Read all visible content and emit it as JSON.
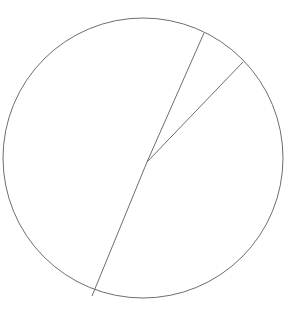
{
  "figure": {
    "type": "geometry-diagram",
    "background_color": "#ffffff",
    "stroke_color": "#6e6e6e",
    "stroke_width": 1,
    "canvas": {
      "width": 304,
      "height": 316
    },
    "circle": {
      "label": "circle",
      "center_x": 143,
      "center_y": 158,
      "radius": 140,
      "bounds": {
        "left": 3,
        "right": 283,
        "top": 18,
        "bottom": 298
      }
    },
    "center_point": {
      "label": "center",
      "x": 147,
      "y": 162
    },
    "radii": [
      {
        "label": "radius-upper-left",
        "from_x": 147,
        "from_y": 162,
        "to_x": 204,
        "to_y": 33
      },
      {
        "label": "radius-upper-right",
        "from_x": 147,
        "from_y": 162,
        "to_x": 243,
        "to_y": 62
      },
      {
        "label": "radius-lower-left",
        "from_x": 147,
        "from_y": 162,
        "to_x": 92,
        "to_y": 296
      }
    ]
  },
  "chart_data": {
    "type": "scatter",
    "title": "",
    "xlabel": "",
    "ylabel": "",
    "xlim": [
      0,
      304
    ],
    "ylim": [
      0,
      316
    ],
    "grid": false,
    "legend": "none",
    "annotations": [],
    "shapes": [
      {
        "kind": "circle",
        "cx": 143,
        "cy": 158,
        "r": 140,
        "stroke": "#6e6e6e",
        "fill": "none"
      },
      {
        "kind": "line",
        "x1": 147,
        "y1": 162,
        "x2": 204,
        "y2": 33,
        "stroke": "#6e6e6e"
      },
      {
        "kind": "line",
        "x1": 147,
        "y1": 162,
        "x2": 243,
        "y2": 62,
        "stroke": "#6e6e6e"
      },
      {
        "kind": "line",
        "x1": 147,
        "y1": 162,
        "x2": 92,
        "y2": 296,
        "stroke": "#6e6e6e"
      }
    ]
  }
}
